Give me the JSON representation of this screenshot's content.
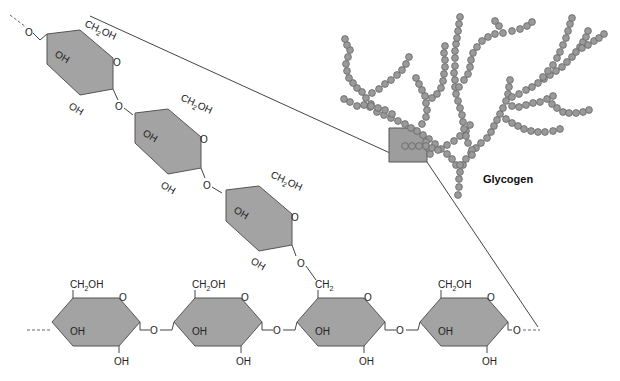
{
  "diagram": {
    "title": "Glycogen",
    "colors": {
      "ring_fill": "#a3a3a3",
      "bead_fill": "#9a9a9a",
      "line": "#444444"
    },
    "labels": {
      "ch2oh": "CH",
      "ch2oh_sub": "2",
      "ch2oh_tail": "OH",
      "ch2": "CH",
      "ch2_sub": "2",
      "oh": "OH",
      "o": "O"
    },
    "branch_chain_units": 3,
    "main_chain_units": 4,
    "branch_point_unit_index": 3
  }
}
